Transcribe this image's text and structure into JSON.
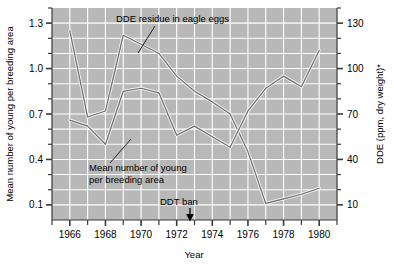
{
  "chart_data": {
    "type": "line",
    "title": "",
    "xlabel": "Year",
    "ylabel": "Mean number of young per breeding area",
    "ylabel_right": "DDE (ppm, dry weight)*",
    "xlim": [
      1965,
      1981
    ],
    "ylim": [
      0.0,
      1.4
    ],
    "ylim_right": [
      0,
      140
    ],
    "xticks": [
      1966,
      1968,
      1970,
      1972,
      1974,
      1976,
      1978,
      1980
    ],
    "xtick_labels": [
      "1966",
      "1968",
      "1970",
      "1972",
      "1974",
      "1976",
      "1978",
      "1980"
    ],
    "xminor_ticks": [
      1965,
      1967,
      1969,
      1971,
      1973,
      1975,
      1977,
      1979,
      1981
    ],
    "yticks": [
      0.1,
      0.4,
      0.7,
      1.0,
      1.3
    ],
    "ytick_labels": [
      "0.1",
      "0.4",
      "0.7",
      "1.0",
      "1.3"
    ],
    "yminor_ticks": [
      0.2,
      0.3,
      0.5,
      0.6,
      0.8,
      0.9,
      1.1,
      1.2,
      1.4
    ],
    "yticks_right": [
      10,
      40,
      70,
      100,
      130
    ],
    "ytick_labels_right": [
      "10",
      "40",
      "70",
      "100",
      "130"
    ],
    "yminor_ticks_right": [
      20,
      30,
      50,
      60,
      80,
      90,
      110,
      120,
      140
    ],
    "grid": true,
    "legend_position": "inline-annotations",
    "plot_background": "#b8b8b8",
    "grid_color": "#ffffff",
    "line_color": "#6e6e6e",
    "series": [
      {
        "name": "DDE residue in eagle eggs",
        "axis": "right",
        "x": [
          1966,
          1967,
          1968,
          1969,
          1970,
          1971,
          1972,
          1973,
          1974,
          1975,
          1976,
          1977,
          1978,
          1979,
          1980
        ],
        "values": [
          125,
          68,
          72,
          122,
          116,
          110,
          95,
          85,
          78,
          70,
          45,
          11,
          14,
          17,
          21
        ]
      },
      {
        "name": "Mean number of young per breeding area",
        "axis": "left",
        "x": [
          1966,
          1967,
          1968,
          1969,
          1970,
          1971,
          1972,
          1973,
          1974,
          1975,
          1976,
          1977,
          1978,
          1979,
          1980
        ],
        "values": [
          0.66,
          0.62,
          0.5,
          0.85,
          0.87,
          0.84,
          0.56,
          0.62,
          0.55,
          0.48,
          0.72,
          0.87,
          0.95,
          0.88,
          1.12
        ]
      }
    ],
    "annotations": [
      {
        "text": "DDE residue in eagle eggs",
        "target": "dde-series"
      },
      {
        "text": "Mean number of young per breeding area",
        "target": "young-series"
      },
      {
        "text": "DDT ban",
        "x": 1972.6,
        "marker": "down-arrow"
      }
    ]
  },
  "labels": {
    "left_axis_title": "Mean number of young per breeding area",
    "right_axis_title": "DDE (ppm, dry weight)*",
    "x_axis_title": "Year",
    "annotation_dde": "DDE residue in eagle eggs",
    "annotation_young_line1": "Mean number of young",
    "annotation_young_line2": "per breeding area",
    "annotation_ddt_ban": "DDT ban"
  }
}
